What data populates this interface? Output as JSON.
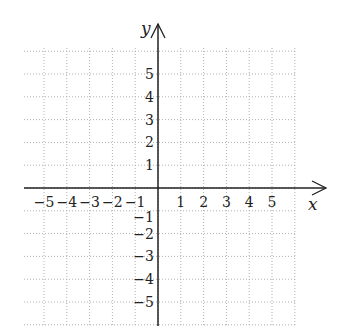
{
  "chart_data": {
    "type": "scatter",
    "title": "",
    "xlabel": "x",
    "ylabel": "y",
    "xlim": [
      -6,
      6
    ],
    "ylim": [
      -6,
      6
    ],
    "grid": true,
    "grid_style": "dotted",
    "x_ticks": [
      -5,
      -4,
      -3,
      -2,
      -1,
      1,
      2,
      3,
      4,
      5
    ],
    "y_ticks": [
      -5,
      -4,
      -3,
      -2,
      -1,
      1,
      2,
      3,
      4,
      5
    ],
    "x_tick_labels": [
      "−5",
      "−4",
      "−3",
      "−2",
      "−1",
      "1",
      "2",
      "3",
      "4",
      "5"
    ],
    "y_tick_labels": [
      "5",
      "4",
      "3",
      "2",
      "1",
      "−1",
      "−2",
      "−3",
      "−4",
      "−5"
    ],
    "series": [],
    "legend": null
  },
  "colors": {
    "axis": "#222222",
    "grid": "#b0b0b0",
    "background": "#ffffff"
  }
}
